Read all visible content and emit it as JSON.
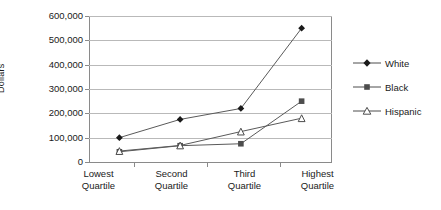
{
  "chart_data": {
    "type": "line",
    "title": "",
    "xlabel": "",
    "ylabel": "Dollars",
    "ylim": [
      0,
      600000
    ],
    "grid": true,
    "legend_position": "right",
    "categories": [
      "Lowest\nQuartile",
      "Second\nQuartile",
      "Third\nQuartile",
      "Highest\nQuartile"
    ],
    "y_ticks": [
      "0",
      "100,000",
      "200,000",
      "300,000",
      "400,000",
      "500,000",
      "600,000"
    ],
    "y_tick_values": [
      0,
      100000,
      200000,
      300000,
      400000,
      500000,
      600000
    ],
    "series": [
      {
        "name": "White",
        "marker": "filled-diamond",
        "color": "#1a1a1a",
        "values": [
          100000,
          175000,
          220000,
          550000
        ]
      },
      {
        "name": "Black",
        "marker": "filled-square",
        "color": "#4d4d4d",
        "values": [
          42000,
          67000,
          75000,
          250000
        ]
      },
      {
        "name": "Hispanic",
        "marker": "open-triangle",
        "color": "#4d4d4d",
        "values": [
          45000,
          68000,
          125000,
          180000
        ]
      }
    ]
  },
  "legend": {
    "items": [
      {
        "label": "White"
      },
      {
        "label": "Black"
      },
      {
        "label": "Hispanic"
      }
    ]
  }
}
